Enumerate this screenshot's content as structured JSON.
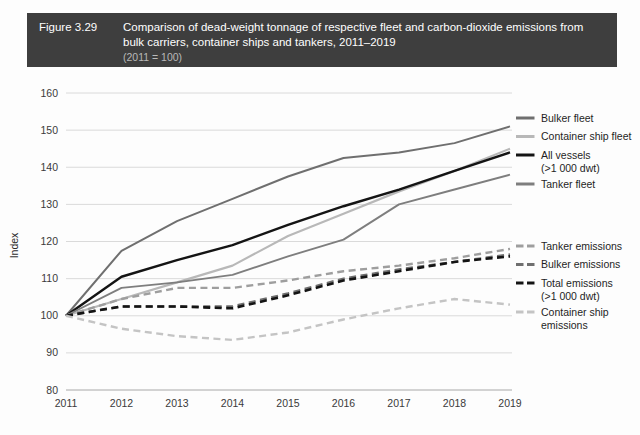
{
  "header": {
    "figure_number": "Figure 3.29",
    "title": "Comparison of dead-weight tonnage of respective fleet and carbon-dioxide emissions from bulk carriers, container ships and tankers, 2011–2019",
    "subtitle": "(2011 = 100)",
    "background_color": "#3e3e3e",
    "text_color": "#ffffff",
    "subtitle_color": "#b9b9b9"
  },
  "chart_data": {
    "type": "line",
    "title": "Comparison of dead-weight tonnage of respective fleet and carbon-dioxide emissions from bulk carriers, container ships and tankers, 2011–2019",
    "subtitle": "(2011 = 100)",
    "xlabel": "",
    "ylabel": "Index",
    "x": [
      2011,
      2012,
      2013,
      2014,
      2015,
      2016,
      2017,
      2018,
      2019
    ],
    "categories": [
      "2011",
      "2012",
      "2013",
      "2014",
      "2015",
      "2016",
      "2017",
      "2018",
      "2019"
    ],
    "ylim": [
      80,
      160
    ],
    "yticks": [
      80,
      90,
      100,
      110,
      120,
      130,
      140,
      150,
      160
    ],
    "xlim": [
      2011,
      2019
    ],
    "grid": true,
    "legend_position": "right",
    "series": [
      {
        "name": "Bulker fleet",
        "values": [
          100,
          117.5,
          125.5,
          131.5,
          137.5,
          142.5,
          144,
          146.5,
          151
        ],
        "color": "#6f6f6f",
        "style": "solid",
        "width": 2.0
      },
      {
        "name": "Container ship fleet",
        "values": [
          100,
          104.5,
          109,
          113.5,
          121.5,
          127.5,
          133.5,
          139,
          145
        ],
        "color": "#b8b8b8",
        "style": "solid",
        "width": 2.2
      },
      {
        "name": "All vessels (>1 000 dwt)",
        "label_line1": "All vessels",
        "label_line2": "(>1 000 dwt)",
        "values": [
          100,
          110.5,
          115,
          119,
          124.5,
          129.5,
          134,
          139,
          144
        ],
        "color": "#141414",
        "style": "solid",
        "width": 2.4
      },
      {
        "name": "Tanker fleet",
        "values": [
          100,
          107.5,
          109,
          111,
          116,
          120.5,
          130,
          134,
          138
        ],
        "color": "#7e7e7e",
        "style": "solid",
        "width": 1.9
      },
      {
        "name": "Tanker emissions",
        "values": [
          100,
          104.5,
          107.5,
          107.5,
          109.5,
          112,
          113.5,
          115.5,
          118
        ],
        "color": "#9e9e9e",
        "style": "dashed",
        "width": 2.4
      },
      {
        "name": "Bulker emissions",
        "values": [
          100,
          102.5,
          102.5,
          102.5,
          106,
          110,
          112.5,
          114.5,
          116.5
        ],
        "color": "#6f6f6f",
        "style": "dashed",
        "width": 2.4
      },
      {
        "name": "Total emissions (>1 000 dwt)",
        "label_line1": "Total emissions",
        "label_line2": "(>1 000 dwt)",
        "values": [
          100,
          102.5,
          102.5,
          102,
          105.5,
          109.5,
          112,
          114.5,
          116
        ],
        "color": "#141414",
        "style": "dashed",
        "width": 2.6
      },
      {
        "name": "Container ship emissions",
        "label_line1": "Container ship",
        "label_line2": "emissions",
        "values": [
          100,
          96.5,
          94.5,
          93.5,
          95.5,
          99,
          102,
          104.5,
          103
        ],
        "color": "#c4c4c4",
        "style": "dashed",
        "width": 2.4
      }
    ]
  },
  "legend": {
    "fleet_group": [
      {
        "label": "Bulker fleet",
        "color": "#6f6f6f",
        "style": "solid"
      },
      {
        "label": "Container ship fleet",
        "color": "#b8b8b8",
        "style": "solid"
      },
      {
        "label": "All vessels",
        "label2": "(>1 000 dwt)",
        "color": "#141414",
        "style": "solid"
      },
      {
        "label": "Tanker fleet",
        "color": "#7e7e7e",
        "style": "solid"
      }
    ],
    "emissions_group": [
      {
        "label": "Tanker emissions",
        "color": "#9e9e9e",
        "style": "dashed"
      },
      {
        "label": "Bulker emissions",
        "color": "#6f6f6f",
        "style": "dashed"
      },
      {
        "label": "Total emissions",
        "label2": "(>1 000 dwt)",
        "color": "#141414",
        "style": "dashed"
      },
      {
        "label": "Container ship",
        "label2": "emissions",
        "color": "#c4c4c4",
        "style": "dashed"
      }
    ]
  },
  "axes": {
    "y_title": "Index",
    "y_ticks": [
      "160",
      "150",
      "140",
      "130",
      "120",
      "110",
      "100",
      "90",
      "80"
    ],
    "x_ticks": [
      "2011",
      "2012",
      "2013",
      "2014",
      "2015",
      "2016",
      "2017",
      "2018",
      "2019"
    ]
  }
}
